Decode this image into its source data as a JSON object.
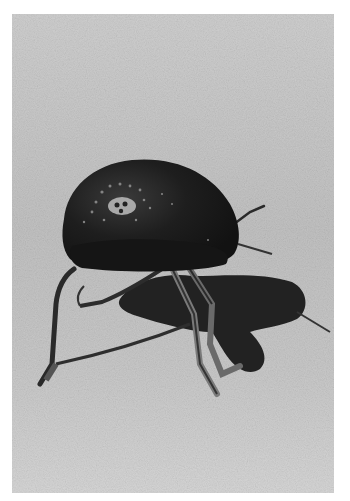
{
  "image": {
    "subject": "beetle on sand",
    "style": "grayscale photograph",
    "colors": {
      "page_background": "#ffffff",
      "sand_light": "#d2d2d2",
      "sand_mid": "#bdbdbd",
      "beetle_body": "#1c1c1c",
      "shadow": "#222222",
      "leg": "#3a3a3a",
      "leg_highlight": "#8a8a8a"
    }
  }
}
